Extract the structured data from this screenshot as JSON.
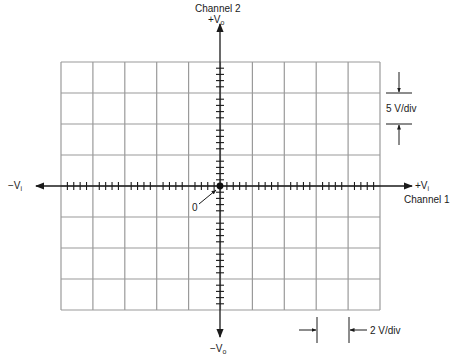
{
  "diagram": {
    "type": "oscilloscope-xy-graticule",
    "grid": {
      "columns": 10,
      "rows": 8,
      "minor_ticks_per_division": 5,
      "line_color": "#9a9a9a",
      "axis_color": "#1a1a1a"
    },
    "labels": {
      "channel2": "Channel 2",
      "channel1": "Channel 1",
      "plus_vo_main": "+V",
      "plus_vo_sub": "o",
      "minus_vo_main": "−V",
      "minus_vo_sub": "o",
      "plus_vi_main": "+V",
      "plus_vi_sub": "i",
      "minus_vi_main": "−V",
      "minus_vi_sub": "i",
      "origin": "0",
      "vertical_scale": "5 V/div",
      "horizontal_scale": "2 V/div"
    },
    "origin_dot": {
      "x": 220,
      "y": 186,
      "color": "#111111"
    }
  }
}
